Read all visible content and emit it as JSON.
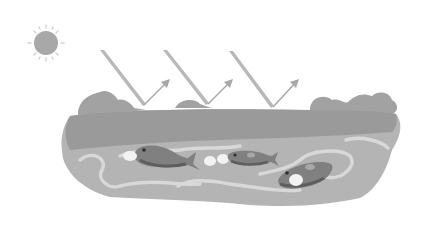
{
  "scene": {
    "description": "Grayscale illustration of sunlight reflecting off an ocean surface with fish swimming below",
    "elements": [
      "sun",
      "light-rays",
      "reflected-arrows",
      "waves",
      "water-body",
      "fish"
    ],
    "ray_count": 3,
    "fish_count": 3
  },
  "colors": {
    "background": "#ffffff",
    "sun": "#a9a9a9",
    "sun_rays": "#d0d0d0",
    "rays": "#b5b5b5",
    "waves": "#9c9c9c",
    "water": "#b8b8b8",
    "water_light": "#d6d6d6",
    "fish": "#7d7d7d",
    "fish_dark": "#5e5e5e",
    "bubbles": "#f2f2f2"
  }
}
